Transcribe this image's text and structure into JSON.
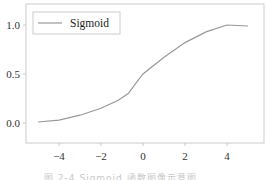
{
  "chart_data": {
    "type": "line",
    "title": "",
    "xlabel": "",
    "ylabel": "",
    "xlim": [
      -5.5,
      5.5
    ],
    "ylim": [
      -0.2,
      1.2
    ],
    "grid": false,
    "legend_position": "upper left",
    "x_ticks": [
      -4,
      -2,
      0,
      2,
      4
    ],
    "x_tick_labels": [
      "−4",
      "−2",
      "0",
      "2",
      "4"
    ],
    "y_ticks": [
      0.0,
      0.5,
      1.0
    ],
    "y_tick_labels": [
      "0.0",
      "0.5",
      "1.0"
    ],
    "series": [
      {
        "name": "Sigmoid",
        "color": "#999999",
        "x": [
          -5,
          -4,
          -3,
          -2,
          -1.2,
          -0.7,
          -0.4,
          0,
          1,
          2,
          3,
          4,
          5
        ],
        "y": [
          0.01,
          0.03,
          0.08,
          0.15,
          0.23,
          0.3,
          0.39,
          0.5,
          0.67,
          0.82,
          0.93,
          1.0,
          0.99
        ]
      }
    ]
  },
  "legend": {
    "label": "Sigmoid"
  },
  "caption": "图 2-4  Sigmoid 函数图像示意图",
  "colors": {
    "frame": "#cccccc",
    "line": "#999999",
    "text": "#333333"
  }
}
